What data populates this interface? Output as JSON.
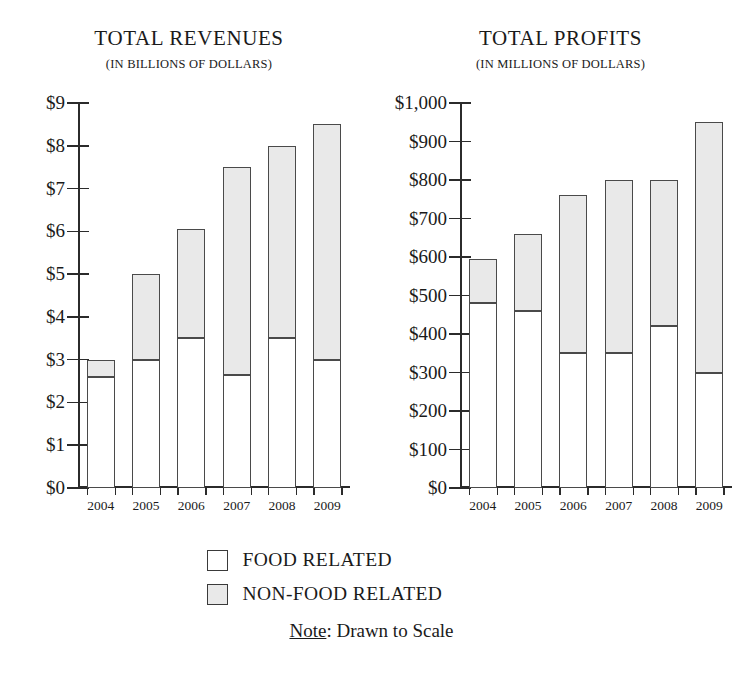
{
  "legend": {
    "items": [
      {
        "label": "FOOD RELATED",
        "key": "food",
        "color": "#ffffff"
      },
      {
        "label": "NON-FOOD RELATED",
        "key": "nonfood",
        "color": "#e9e9e9"
      }
    ],
    "note_lead": "Note",
    "note_rest": ": Drawn to Scale"
  },
  "chart_data": [
    {
      "type": "bar",
      "id": "total-revenues",
      "title": "TOTAL REVENUES",
      "subtitle": "(IN BILLIONS OF DOLLARS)",
      "stacked": true,
      "grid": false,
      "legend_position": "bottom",
      "xlabel": "",
      "ylabel": "",
      "ylim": [
        0,
        9
      ],
      "ytick_values": [
        0,
        1,
        2,
        3,
        4,
        5,
        6,
        7,
        8,
        9
      ],
      "ytick_labels": [
        "$0",
        "$1",
        "$2",
        "$3",
        "$4",
        "$5",
        "$6",
        "$7",
        "$8",
        "$9"
      ],
      "categories": [
        "2004",
        "2005",
        "2006",
        "2007",
        "2008",
        "2009"
      ],
      "series": [
        {
          "name": "FOOD RELATED",
          "values": [
            2.6,
            3.0,
            3.5,
            2.65,
            3.5,
            3.0
          ]
        },
        {
          "name": "NON-FOOD RELATED",
          "values": [
            0.4,
            2.0,
            2.55,
            4.85,
            4.5,
            5.5
          ]
        }
      ],
      "totals": [
        3.0,
        5.0,
        6.05,
        7.5,
        8.0,
        8.5
      ]
    },
    {
      "type": "bar",
      "id": "total-profits",
      "title": "TOTAL PROFITS",
      "subtitle": "(IN MILLIONS OF DOLLARS)",
      "stacked": true,
      "grid": false,
      "legend_position": "bottom",
      "xlabel": "",
      "ylabel": "",
      "ylim": [
        0,
        1000
      ],
      "ytick_values": [
        0,
        100,
        200,
        300,
        400,
        500,
        600,
        700,
        800,
        900,
        1000
      ],
      "ytick_labels": [
        "$0",
        "$100",
        "$200",
        "$300",
        "$400",
        "$500",
        "$600",
        "$700",
        "$800",
        "$900",
        "$1,000"
      ],
      "categories": [
        "2004",
        "2005",
        "2006",
        "2007",
        "2008",
        "2009"
      ],
      "series": [
        {
          "name": "FOOD RELATED",
          "values": [
            480,
            460,
            350,
            350,
            420,
            300
          ]
        },
        {
          "name": "NON-FOOD RELATED",
          "values": [
            115,
            200,
            410,
            450,
            380,
            650
          ]
        }
      ],
      "totals": [
        595,
        660,
        760,
        800,
        800,
        950
      ]
    }
  ]
}
